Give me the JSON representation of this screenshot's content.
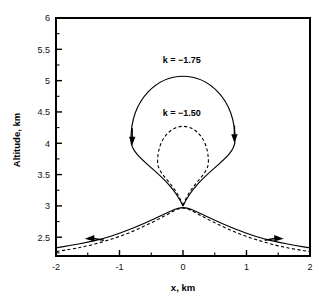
{
  "chart_data": {
    "type": "line",
    "title": "",
    "xlabel": "x, km",
    "ylabel": "Altitude, km",
    "xlim": [
      -2,
      2
    ],
    "ylim": [
      2.2,
      6
    ],
    "grid": false,
    "legend_position": "inline-annotations",
    "x_ticks": [
      -2,
      -1,
      0,
      1,
      2
    ],
    "x_tick_labels": [
      "-2",
      "-1",
      "0",
      "1",
      "2"
    ],
    "x_minor_ticks": [
      -1.5,
      -0.5,
      0.5,
      1.5
    ],
    "y_ticks": [
      2.5,
      3,
      3.5,
      4,
      4.5,
      5,
      5.5,
      6
    ],
    "y_tick_labels": [
      "2.5",
      "3",
      "3.5",
      "4",
      "4.5",
      "5",
      "5.5",
      "6"
    ],
    "y_minor_ticks": [
      2.25,
      2.75,
      3.25,
      3.75,
      4.25,
      4.75,
      5.25,
      5.75
    ],
    "annotations": [
      {
        "text": "k = −1.75",
        "x": -0.02,
        "y": 5.28
      },
      {
        "text": "k = −1.50",
        "x": -0.02,
        "y": 4.43
      }
    ],
    "series": [
      {
        "name": "k = −1.75",
        "style": "solid",
        "crossing_point": [
          0,
          3
        ],
        "loop_top": [
          0,
          5.07
        ],
        "loop_left": [
          -0.82,
          4.05
        ],
        "loop_right": [
          0.82,
          4.05
        ],
        "tail_left_end": [
          -2,
          2.33
        ],
        "tail_right_end": [
          2,
          2.33
        ],
        "points": [
          [
            -2,
            2.33
          ],
          [
            -1.75,
            2.37
          ],
          [
            -1.5,
            2.42
          ],
          [
            -1.25,
            2.48
          ],
          [
            -1,
            2.56
          ],
          [
            -0.75,
            2.66
          ],
          [
            -0.5,
            2.77
          ],
          [
            -0.25,
            2.89
          ],
          [
            0,
            3
          ],
          [
            0.25,
            2.89
          ],
          [
            0.5,
            2.77
          ],
          [
            0.75,
            2.66
          ],
          [
            1,
            2.56
          ],
          [
            1.25,
            2.48
          ],
          [
            1.5,
            2.42
          ],
          [
            1.75,
            2.37
          ],
          [
            2,
            2.33
          ]
        ]
      },
      {
        "name": "k = −1.50",
        "style": "dashed",
        "crossing_point": [
          0,
          3
        ],
        "loop_top": [
          0,
          4.27
        ],
        "loop_left": [
          -0.4,
          3.7
        ],
        "loop_right": [
          0.4,
          3.7
        ],
        "tail_left_end": [
          -2,
          2.27
        ],
        "tail_right_end": [
          2,
          2.27
        ],
        "points": [
          [
            -2,
            2.27
          ],
          [
            -1.75,
            2.31
          ],
          [
            -1.5,
            2.36
          ],
          [
            -1.25,
            2.43
          ],
          [
            -1,
            2.51
          ],
          [
            -0.75,
            2.61
          ],
          [
            -0.5,
            2.73
          ],
          [
            -0.25,
            2.86
          ],
          [
            0,
            3
          ],
          [
            0.25,
            2.86
          ],
          [
            0.5,
            2.73
          ],
          [
            0.75,
            2.61
          ],
          [
            1,
            2.51
          ],
          [
            1.25,
            2.43
          ],
          [
            1.5,
            2.36
          ],
          [
            1.75,
            2.31
          ],
          [
            2,
            2.27
          ]
        ]
      }
    ],
    "direction_arrows": [
      {
        "name": "loop-left-arrow",
        "x": -0.8,
        "y": 4.08,
        "direction": "down"
      },
      {
        "name": "loop-right-arrow",
        "x": 0.81,
        "y": 4.12,
        "direction": "down"
      },
      {
        "name": "tail-left-arrow",
        "x": -1.42,
        "y": 2.49,
        "direction": "left"
      },
      {
        "name": "tail-right-arrow",
        "x": 1.46,
        "y": 2.49,
        "direction": "right"
      }
    ],
    "colors": {
      "curve": "#000000",
      "axis": "#000000",
      "background": "#ffffff",
      "text": "#000000"
    }
  }
}
